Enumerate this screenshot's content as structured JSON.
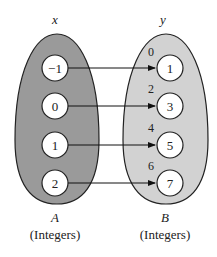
{
  "diagram": {
    "type": "function-mapping",
    "domain_set": {
      "variable": "x",
      "name": "A",
      "description": "(Integers)",
      "fill": "#9a9a9a",
      "elements": [
        "−1",
        "0",
        "1",
        "2"
      ]
    },
    "codomain_set": {
      "variable": "y",
      "name": "B",
      "description": "(Integers)",
      "fill": "#d2d2d2",
      "elements": [
        "1",
        "3",
        "5",
        "7"
      ],
      "unmapped_elements": [
        "0",
        "2",
        "4",
        "6"
      ]
    },
    "mappings": [
      {
        "from": "−1",
        "to": "1"
      },
      {
        "from": "0",
        "to": "3"
      },
      {
        "from": "1",
        "to": "5"
      },
      {
        "from": "2",
        "to": "7"
      }
    ]
  }
}
